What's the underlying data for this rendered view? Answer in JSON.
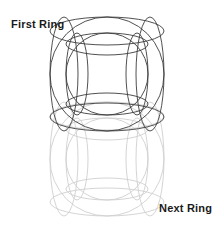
{
  "canvas": {
    "width": 224,
    "height": 231,
    "background": "#ffffff"
  },
  "labels": {
    "first_ring": "First Ring",
    "next_ring": "Next Ring"
  },
  "style": {
    "line_color_primary": "#3c3c3c",
    "line_color_faded": "#cfcfcf",
    "text_color": "#1a1a1a",
    "stroke_width": 0.9
  },
  "diagram": {
    "type": "torus-wireframe-pair",
    "rings": [
      {
        "name": "first-ring",
        "label": "First Ring",
        "emphasis": "primary",
        "color": "#3c3c3c",
        "center_x": 107,
        "center_y": 74,
        "outer_radius": 57,
        "inner_radius": 41,
        "tube_radius": 16,
        "profile_ry": 14,
        "hole_ry": 11
      },
      {
        "name": "next-ring",
        "label": "Next Ring",
        "emphasis": "faded",
        "color": "#cfcfcf",
        "center_x": 107,
        "center_y": 159,
        "outer_radius": 57,
        "inner_radius": 41,
        "tube_radius": 16,
        "profile_ry": 14,
        "hole_ry": 11
      }
    ]
  }
}
